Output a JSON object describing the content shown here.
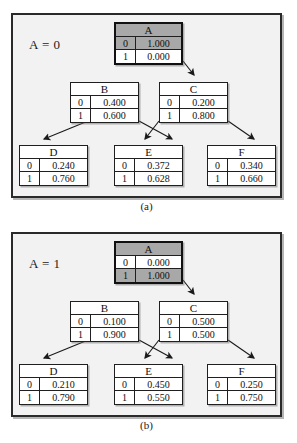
{
  "figure": {
    "caption_a": "(a)",
    "caption_b": "(b)"
  },
  "panels": [
    {
      "id": "a",
      "label": "A = 0",
      "caption": "(a)",
      "nodes": [
        {
          "name": "A",
          "root": true,
          "selected_row": 0,
          "rows": [
            {
              "k": "0",
              "v": "1.000"
            },
            {
              "k": "1",
              "v": "0.000"
            }
          ]
        },
        {
          "name": "B",
          "root": false,
          "selected_row": -1,
          "rows": [
            {
              "k": "0",
              "v": "0.400"
            },
            {
              "k": "1",
              "v": "0.600"
            }
          ]
        },
        {
          "name": "C",
          "root": false,
          "selected_row": -1,
          "rows": [
            {
              "k": "0",
              "v": "0.200"
            },
            {
              "k": "1",
              "v": "0.800"
            }
          ]
        },
        {
          "name": "D",
          "root": false,
          "selected_row": -1,
          "rows": [
            {
              "k": "0",
              "v": "0.240"
            },
            {
              "k": "1",
              "v": "0.760"
            }
          ]
        },
        {
          "name": "E",
          "root": false,
          "selected_row": -1,
          "rows": [
            {
              "k": "0",
              "v": "0.372"
            },
            {
              "k": "1",
              "v": "0.628"
            }
          ]
        },
        {
          "name": "F",
          "root": false,
          "selected_row": -1,
          "rows": [
            {
              "k": "0",
              "v": "0.340"
            },
            {
              "k": "1",
              "v": "0.660"
            }
          ]
        }
      ]
    },
    {
      "id": "b",
      "label": "A = 1",
      "caption": "(b)",
      "nodes": [
        {
          "name": "A",
          "root": true,
          "selected_row": 1,
          "rows": [
            {
              "k": "0",
              "v": "0.000"
            },
            {
              "k": "1",
              "v": "1.000"
            }
          ]
        },
        {
          "name": "B",
          "root": false,
          "selected_row": -1,
          "rows": [
            {
              "k": "0",
              "v": "0.100"
            },
            {
              "k": "1",
              "v": "0.900"
            }
          ]
        },
        {
          "name": "C",
          "root": false,
          "selected_row": -1,
          "rows": [
            {
              "k": "0",
              "v": "0.500"
            },
            {
              "k": "1",
              "v": "0.500"
            }
          ]
        },
        {
          "name": "D",
          "root": false,
          "selected_row": -1,
          "rows": [
            {
              "k": "0",
              "v": "0.210"
            },
            {
              "k": "1",
              "v": "0.790"
            }
          ]
        },
        {
          "name": "E",
          "root": false,
          "selected_row": -1,
          "rows": [
            {
              "k": "0",
              "v": "0.450"
            },
            {
              "k": "1",
              "v": "0.550"
            }
          ]
        },
        {
          "name": "F",
          "root": false,
          "selected_row": -1,
          "rows": [
            {
              "k": "0",
              "v": "0.250"
            },
            {
              "k": "1",
              "v": "0.750"
            }
          ]
        }
      ],
      "edges": [
        {
          "from": "A",
          "to": "C"
        },
        {
          "from": "B",
          "to": "D"
        },
        {
          "from": "B",
          "to": "E"
        },
        {
          "from": "C",
          "to": "E"
        },
        {
          "from": "C",
          "to": "F"
        }
      ]
    }
  ],
  "colors": {
    "panel_background": "#f2f2f2",
    "panel_border": "#2a2a2a",
    "table_border": "#1f1f1f",
    "table_background": "#ffffff",
    "highlight": "#a8a8a8",
    "text": "#111111"
  },
  "layout": {
    "node_positions": {
      "A": {
        "left": 101,
        "top": 7,
        "width": 69
      },
      "B": {
        "left": 57,
        "top": 67,
        "width": 69
      },
      "C": {
        "left": 146,
        "top": 67,
        "width": 69
      },
      "D": {
        "left": 6,
        "top": 130,
        "width": 69
      },
      "E": {
        "left": 101,
        "top": 130,
        "width": 69
      },
      "F": {
        "left": 194,
        "top": 130,
        "width": 69
      }
    }
  }
}
